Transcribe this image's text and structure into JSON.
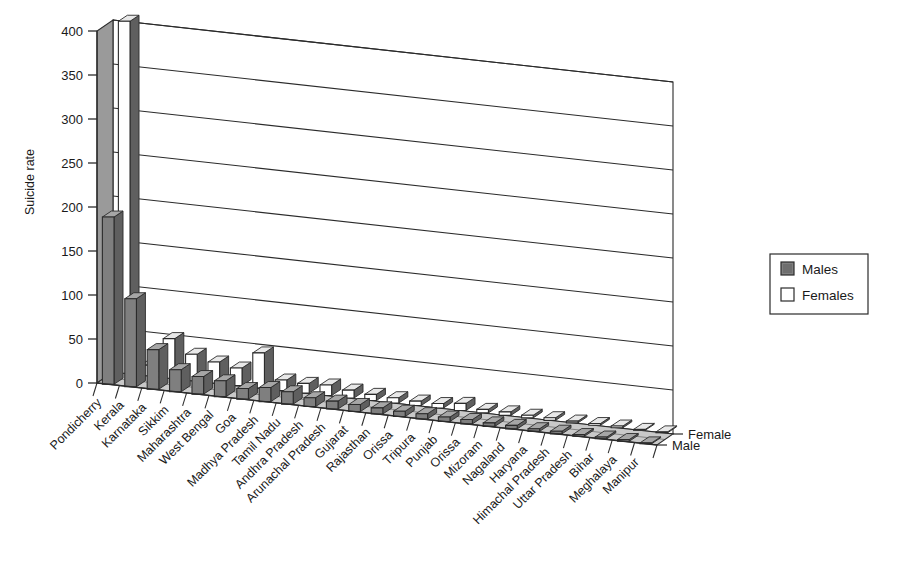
{
  "chart_data": {
    "type": "bar",
    "title": "",
    "subtitle": "",
    "xlabel": "",
    "ylabel": "Suicide rate",
    "ylim": [
      0,
      400
    ],
    "yticks": [
      0,
      50,
      100,
      150,
      200,
      250,
      300,
      350,
      400
    ],
    "ytick_labels": [
      "0",
      "50",
      "100",
      "150",
      "200",
      "250",
      "300",
      "350",
      "400"
    ],
    "grid": true,
    "projection": "3d",
    "legend": {
      "position": "right",
      "entries": [
        {
          "label": "Males",
          "color": "#7f7f7f"
        },
        {
          "label": "Females",
          "color": "#ffffff"
        }
      ]
    },
    "series_axis_labels": [
      "Female",
      "Male"
    ],
    "categories": [
      "Pondicherry",
      "Kerala",
      "Karnataka",
      "Sikkim",
      "Maharashtra",
      "West Bengal",
      "Goa",
      "Madhya Pradesh",
      "Tamil Nadu",
      "Andhra Pradesh",
      "Arunachal Pradesh",
      "Gujarat",
      "Rajasthan",
      "Orissa",
      "Tripura",
      "Punjab",
      "Orissa",
      "Mizoram",
      "Nagaland",
      "Haryana",
      "Himachal Pradesh",
      "Uttar Pradesh",
      "Bihar",
      "Meghalaya",
      "Manipur"
    ],
    "series": [
      {
        "name": "Males",
        "color": "#7f7f7f",
        "values": [
          190,
          100,
          45,
          25,
          20,
          18,
          12,
          16,
          14,
          10,
          9,
          8,
          7,
          6,
          6,
          5,
          5,
          4,
          4,
          3,
          3,
          2,
          2,
          2,
          1
        ]
      },
      {
        "name": "Females",
        "color": "#ffffff",
        "values": [
          400,
          12,
          45,
          30,
          24,
          20,
          40,
          12,
          11,
          12,
          9,
          7,
          6,
          5,
          5,
          8,
          4,
          4,
          3,
          3,
          2,
          2,
          2,
          1,
          1
        ]
      }
    ]
  },
  "legend": {
    "males_label": "Males",
    "females_label": "Females"
  },
  "axes": {
    "y_title": "Suicide rate",
    "series_female": "Female",
    "series_male": "Male"
  },
  "colors": {
    "male_bar": "#808080",
    "female_bar": "#ffffff",
    "side_wall": "#9a9a9a",
    "floor": "#c9c9c9",
    "back_wall": "#ffffff",
    "outline": "#2b2b2b"
  }
}
